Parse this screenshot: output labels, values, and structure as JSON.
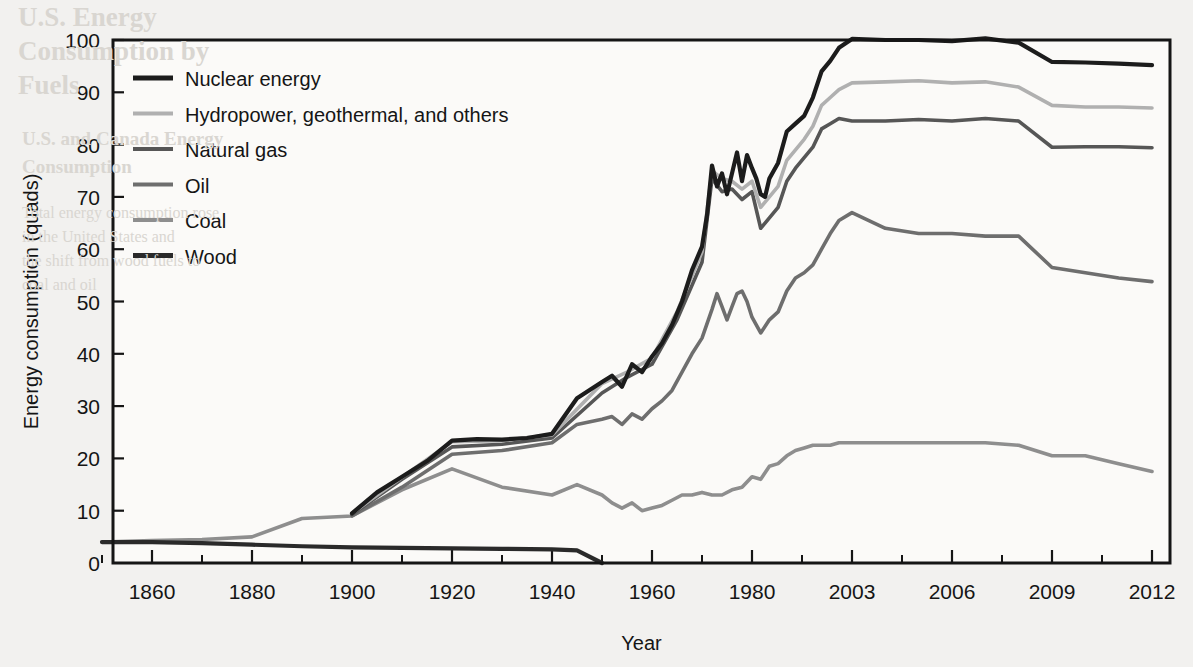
{
  "figure": {
    "background_color": "#f2f1ef",
    "plot_background_color": "#fbfaf8",
    "frame_color": "#151515"
  },
  "axes": {
    "y_axis_title": "Energy consumption (quads)",
    "x_axis_title": "Year",
    "y_ticks": [
      "0",
      "10",
      "20",
      "30",
      "40",
      "50",
      "60",
      "70",
      "80",
      "90",
      "100"
    ],
    "x_ticks": [
      "1860",
      "1880",
      "1900",
      "1920",
      "1940",
      "1960",
      "1980",
      "2003",
      "2006",
      "2009",
      "2012"
    ]
  },
  "legend": {
    "items": [
      {
        "label": "Nuclear energy",
        "color": "#1c1c1c"
      },
      {
        "label": "Hydropower, geothermal, and others",
        "color": "#b0b0b0"
      },
      {
        "label": "Natural gas",
        "color": "#565656"
      },
      {
        "label": "Oil",
        "color": "#6e6e6e"
      },
      {
        "label": "Coal",
        "color": "#8e8e8e"
      },
      {
        "label": "Wood",
        "color": "#2a2a2a"
      }
    ]
  },
  "chart_data": {
    "type": "line",
    "title": "",
    "subtitle": "",
    "xlabel": "Year",
    "ylabel": "Energy consumption (quads)",
    "ylim": [
      0,
      100
    ],
    "grid": false,
    "legend_position": "top-left inside plot",
    "note": "Cumulative (stacked) totals of U.S. energy consumption by source. Each series is the running total including all sources below it in the legend order Wood -> Coal -> Oil -> Natural gas -> Hydropower/geothermal -> Nuclear. X axis is non-uniform: evenly spaced major ticks represent 1860,1880,1900,1920,1940,1960,1980,2003,2006,2009,2012.",
    "x_axis_tick_positions_are_equispaced": true,
    "x_range_start": 1850,
    "x_range_end": 2012,
    "series": [
      {
        "name": "Nuclear energy",
        "color": "#1c1c1c",
        "comment": "Topmost cumulative total (all sources).",
        "x": [
          1900,
          1905,
          1910,
          1915,
          1920,
          1925,
          1930,
          1935,
          1940,
          1945,
          1950,
          1952,
          1954,
          1956,
          1958,
          1960,
          1962,
          1964,
          1966,
          1968,
          1970,
          1971,
          1972,
          1973,
          1974,
          1975,
          1976,
          1977,
          1978,
          1979,
          1980,
          1981,
          1982,
          1983,
          1984,
          1986,
          1988,
          1990,
          1992,
          1994,
          1996,
          1998,
          2000,
          2003,
          2004,
          2005,
          2006,
          2007,
          2008,
          2009,
          2010,
          2011,
          2012
        ],
        "y": [
          9.5,
          13.5,
          16.5,
          19.5,
          23.4,
          23.7,
          23.6,
          23.9,
          24.7,
          31.5,
          34.6,
          35.8,
          33.7,
          38.0,
          36.5,
          39.5,
          42.0,
          45.5,
          50.0,
          56.0,
          60.5,
          66.5,
          76.0,
          72.0,
          74.5,
          70.5,
          74.5,
          78.5,
          73.0,
          78.0,
          75.5,
          73.5,
          70.5,
          70.0,
          73.5,
          76.5,
          82.5,
          84.0,
          85.5,
          89.0,
          94.0,
          96.0,
          98.5,
          100.2,
          100.0,
          100.0,
          99.8,
          100.3,
          99.5,
          95.8,
          95.7,
          95.5,
          95.2
        ]
      },
      {
        "name": "Hydropower, geothermal, and others",
        "color": "#b0b0b0",
        "comment": "Cumulative total excluding nuclear.",
        "x": [
          1900,
          1910,
          1920,
          1930,
          1940,
          1950,
          1955,
          1960,
          1965,
          1970,
          1972,
          1974,
          1976,
          1978,
          1980,
          1982,
          1984,
          1986,
          1988,
          1990,
          1992,
          1994,
          1996,
          1998,
          2000,
          2003,
          2004,
          2005,
          2006,
          2007,
          2008,
          2009,
          2010,
          2011,
          2012
        ],
        "y": [
          9.5,
          16.4,
          23.2,
          23.4,
          24.5,
          34.3,
          36.5,
          39.2,
          48.0,
          59.5,
          75.0,
          73.5,
          73.0,
          71.5,
          73.0,
          68.0,
          70.0,
          72.0,
          77.0,
          79.0,
          81.0,
          83.5,
          87.5,
          89.0,
          90.5,
          91.8,
          92.0,
          92.2,
          91.8,
          92.0,
          91.0,
          87.5,
          87.2,
          87.2,
          87.0
        ]
      },
      {
        "name": "Natural gas",
        "color": "#565656",
        "comment": "Cumulative total of wood + coal + oil + natural gas.",
        "x": [
          1900,
          1910,
          1920,
          1930,
          1940,
          1950,
          1955,
          1960,
          1965,
          1970,
          1972,
          1974,
          1976,
          1978,
          1980,
          1982,
          1984,
          1986,
          1988,
          1990,
          1992,
          1994,
          1996,
          1998,
          2000,
          2003,
          2004,
          2005,
          2006,
          2007,
          2008,
          2009,
          2010,
          2011,
          2012
        ],
        "y": [
          9.3,
          16.0,
          22.2,
          22.7,
          23.9,
          32.5,
          35.5,
          38.0,
          46.5,
          57.5,
          73.5,
          71.0,
          71.5,
          69.5,
          71.0,
          64.0,
          66.0,
          68.0,
          73.0,
          75.5,
          77.5,
          79.5,
          83.0,
          84.0,
          85.0,
          84.5,
          84.5,
          84.8,
          84.5,
          85.0,
          84.5,
          79.5,
          79.6,
          79.6,
          79.4
        ]
      },
      {
        "name": "Oil",
        "color": "#6e6e6e",
        "comment": "Cumulative total of wood + coal + oil.",
        "x": [
          1900,
          1910,
          1920,
          1930,
          1940,
          1945,
          1950,
          1952,
          1954,
          1956,
          1958,
          1960,
          1962,
          1964,
          1966,
          1968,
          1970,
          1972,
          1973,
          1974,
          1975,
          1976,
          1977,
          1978,
          1979,
          1980,
          1982,
          1984,
          1986,
          1988,
          1990,
          1992,
          1994,
          1996,
          1998,
          2000,
          2003,
          2004,
          2005,
          2006,
          2007,
          2008,
          2009,
          2010,
          2011,
          2012
        ],
        "y": [
          9.0,
          14.5,
          20.8,
          21.5,
          23.0,
          26.5,
          27.5,
          28.0,
          26.5,
          28.5,
          27.5,
          29.5,
          31.0,
          33.0,
          36.5,
          40.0,
          43.0,
          48.5,
          51.5,
          49.0,
          46.5,
          49.0,
          51.5,
          52.0,
          50.0,
          47.0,
          44.0,
          46.5,
          48.0,
          52.0,
          54.5,
          55.5,
          57.0,
          60.0,
          63.0,
          65.5,
          67.0,
          64.0,
          63.0,
          63.0,
          62.5,
          62.5,
          56.5,
          55.5,
          54.5,
          53.8
        ]
      },
      {
        "name": "Coal",
        "color": "#8e8e8e",
        "comment": "Cumulative total of wood + coal.",
        "x": [
          1850,
          1860,
          1870,
          1880,
          1890,
          1900,
          1910,
          1920,
          1930,
          1940,
          1945,
          1950,
          1952,
          1954,
          1956,
          1958,
          1960,
          1962,
          1964,
          1966,
          1968,
          1970,
          1972,
          1974,
          1976,
          1978,
          1980,
          1982,
          1984,
          1986,
          1988,
          1990,
          1992,
          1994,
          1996,
          1998,
          2000,
          2003,
          2004,
          2005,
          2006,
          2007,
          2008,
          2009,
          2010,
          2011,
          2012
        ],
        "y": [
          4.0,
          4.3,
          4.5,
          5.0,
          8.5,
          9.0,
          14.0,
          18.0,
          14.5,
          13.0,
          15.0,
          13.0,
          11.5,
          10.5,
          11.5,
          10.0,
          10.5,
          11.0,
          12.0,
          13.0,
          13.0,
          13.5,
          13.0,
          13.0,
          14.0,
          14.5,
          16.5,
          16.0,
          18.5,
          19.0,
          20.5,
          21.5,
          22.0,
          22.5,
          22.5,
          22.5,
          23.0,
          23.0,
          23.0,
          23.0,
          23.0,
          23.0,
          22.5,
          20.5,
          20.5,
          19.0,
          17.5
        ]
      },
      {
        "name": "Wood",
        "color": "#2a2a2a",
        "comment": "Wood alone; declines to zero around 1950.",
        "x": [
          1850,
          1860,
          1870,
          1880,
          1890,
          1900,
          1910,
          1920,
          1930,
          1940,
          1945,
          1950
        ],
        "y": [
          4.0,
          4.0,
          3.8,
          3.5,
          3.2,
          3.0,
          2.9,
          2.8,
          2.7,
          2.6,
          2.4,
          0.0
        ]
      }
    ]
  },
  "background_text": {
    "line1": "U.S. Energy",
    "line2": "Consumption by",
    "line3": "Fuels",
    "line4": "U.S. and Canada Energy",
    "line5": "Consumption",
    "body1": "Total energy consumption rose",
    "body2": "in the United States and",
    "body3": "the shift from wood fuels to",
    "body4": "coal and oil"
  }
}
